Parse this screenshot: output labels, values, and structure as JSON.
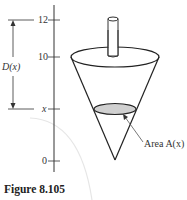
{
  "figure": {
    "caption": "Figure 8.105",
    "axis": {
      "ticks": [
        {
          "label": "12",
          "y": 20
        },
        {
          "label": "10",
          "y": 57
        },
        {
          "label": "x",
          "y": 109
        },
        {
          "label": "0",
          "y": 161
        }
      ]
    },
    "dimension_label": "D(x)",
    "area_label": "Area A(x)",
    "colors": {
      "line": "#222222",
      "cross_section_fill": "#d0d0d0",
      "background_arc": "#e6e6e6"
    }
  }
}
